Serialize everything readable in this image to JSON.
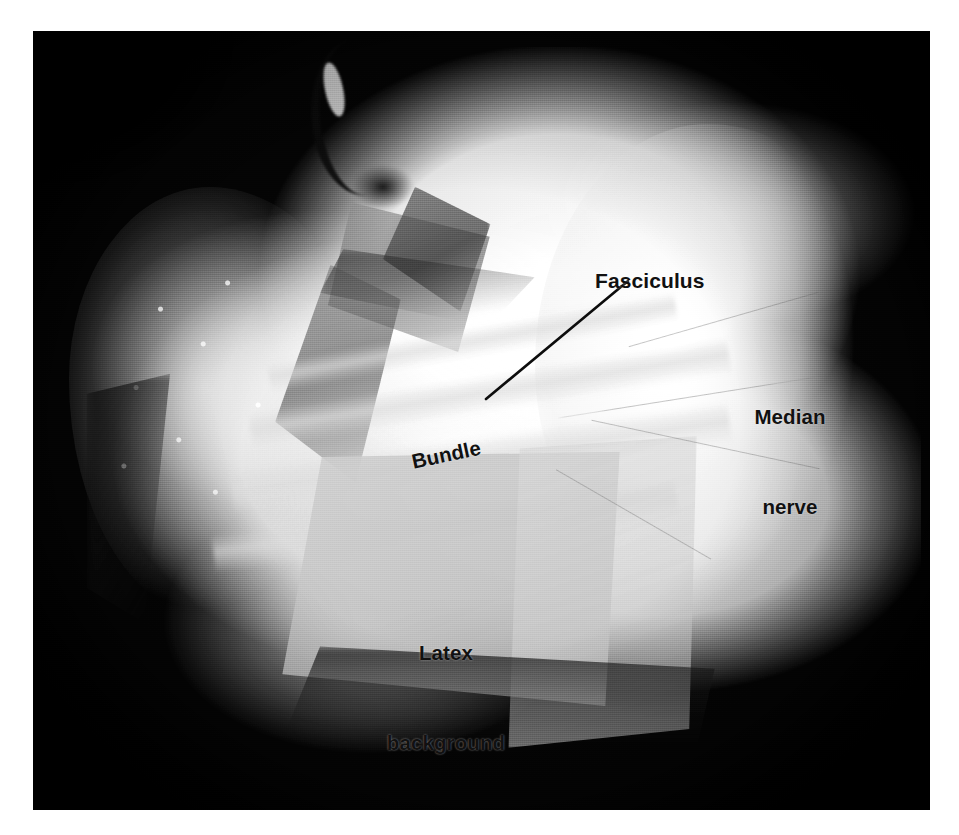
{
  "figure": {
    "kind": "anatomical-photograph",
    "rendering": "black-and-white halftone photograph on white page",
    "photo_frame": {
      "x": 33,
      "y": 31,
      "width": 897,
      "height": 779
    }
  },
  "annotations": {
    "fasciculus": {
      "label": "Fasciculus",
      "x": 595,
      "y": 269,
      "rotation_deg": 0,
      "has_leader_line": true
    },
    "median_nerve": {
      "line1": "Median",
      "line2": "nerve",
      "x": 742,
      "y": 342,
      "rotation_deg": 0,
      "has_leader_line": false
    },
    "bundle": {
      "label": "Bundle",
      "x": 412,
      "y": 450,
      "rotation_deg": -12,
      "has_leader_line": false
    },
    "latex_background": {
      "line1": "Latex",
      "line2": "background",
      "x": 386,
      "y": 578,
      "rotation_deg": 0,
      "has_leader_line": false
    }
  },
  "leader_line": {
    "name": "fasciculus-leader-line",
    "from_x": 486,
    "from_y": 399,
    "to_x": 628,
    "to_y": 281,
    "color": "#0d0d0d",
    "width_px": 2.6
  },
  "palette": {
    "page_background": "#ffffff",
    "photo_background": "#0a0a0a",
    "specimen_highlight": "#fdfdfd",
    "fascicle_gray": "#6c6c6c",
    "latex_gray": "#c8c8c8",
    "annotation_text": "#111111"
  }
}
